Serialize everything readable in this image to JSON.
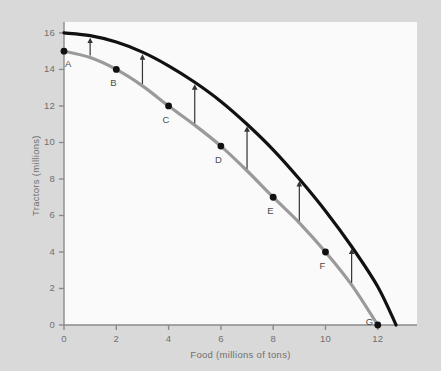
{
  "chart_data": {
    "type": "line",
    "title": "",
    "xlabel": "Food (millions of tons)",
    "ylabel": "Tractors (millions)",
    "xlim": [
      0,
      13.5
    ],
    "ylim": [
      0,
      16.6
    ],
    "xticks": [
      0,
      2,
      4,
      6,
      8,
      10,
      12
    ],
    "yticks": [
      0,
      2,
      4,
      6,
      8,
      10,
      12,
      14,
      16
    ],
    "grid": false,
    "legend": "none",
    "series": [
      {
        "name": "inner-frontier",
        "color": "#9a9a9a",
        "style": "solid",
        "width": 3.2,
        "x": [
          0,
          1,
          2,
          3,
          4,
          5,
          6,
          7,
          8,
          9,
          10,
          11,
          12
        ],
        "y": [
          15,
          14.65,
          14,
          13.1,
          12,
          10.95,
          9.8,
          8.45,
          7,
          5.6,
          4,
          2.2,
          0
        ]
      },
      {
        "name": "outer-frontier",
        "color": "#111111",
        "style": "solid",
        "width": 3.2,
        "x": [
          0,
          1,
          2,
          3,
          4,
          5,
          6,
          7,
          8,
          9,
          10,
          11,
          12,
          12.7
        ],
        "y": [
          16,
          15.85,
          15.5,
          14.95,
          14.2,
          13.3,
          12.25,
          11.0,
          9.6,
          8.0,
          6.25,
          4.3,
          2.1,
          0
        ]
      }
    ],
    "points": [
      {
        "label": "A",
        "x": 0,
        "y": 15,
        "label_dx": 4,
        "label_dy": 14
      },
      {
        "label": "B",
        "x": 2,
        "y": 14,
        "label_dx": -3,
        "label_dy": 15
      },
      {
        "label": "C",
        "x": 4,
        "y": 12,
        "label_dx": -3,
        "label_dy": 15
      },
      {
        "label": "D",
        "x": 6,
        "y": 9.8,
        "label_dx": -3,
        "label_dy": 15
      },
      {
        "label": "E",
        "x": 8,
        "y": 7,
        "label_dx": -3,
        "label_dy": 15
      },
      {
        "label": "F",
        "x": 10,
        "y": 4,
        "label_dx": -3,
        "label_dy": 15
      },
      {
        "label": "G",
        "x": 12,
        "y": 0,
        "label_dx": -9,
        "label_dy": -2
      }
    ],
    "arrows": [
      {
        "x": 1,
        "y_from": 14.65,
        "y_to": 15.85
      },
      {
        "x": 3,
        "y_from": 13.1,
        "y_to": 14.95
      },
      {
        "x": 5,
        "y_from": 10.95,
        "y_to": 13.3
      },
      {
        "x": 7,
        "y_from": 8.45,
        "y_to": 11.0
      },
      {
        "x": 9,
        "y_from": 5.6,
        "y_to": 8.0
      },
      {
        "x": 11,
        "y_from": 2.2,
        "y_to": 4.3
      }
    ],
    "colors": {
      "background": "#d9d9d9",
      "panel": "#fafafa",
      "axis": "#8a8a8a",
      "tick_text": "#6f6f6f",
      "inner_curve": "#9a9a9a",
      "outer_curve": "#111111",
      "point": "#111111",
      "arrow": "#333333"
    }
  }
}
